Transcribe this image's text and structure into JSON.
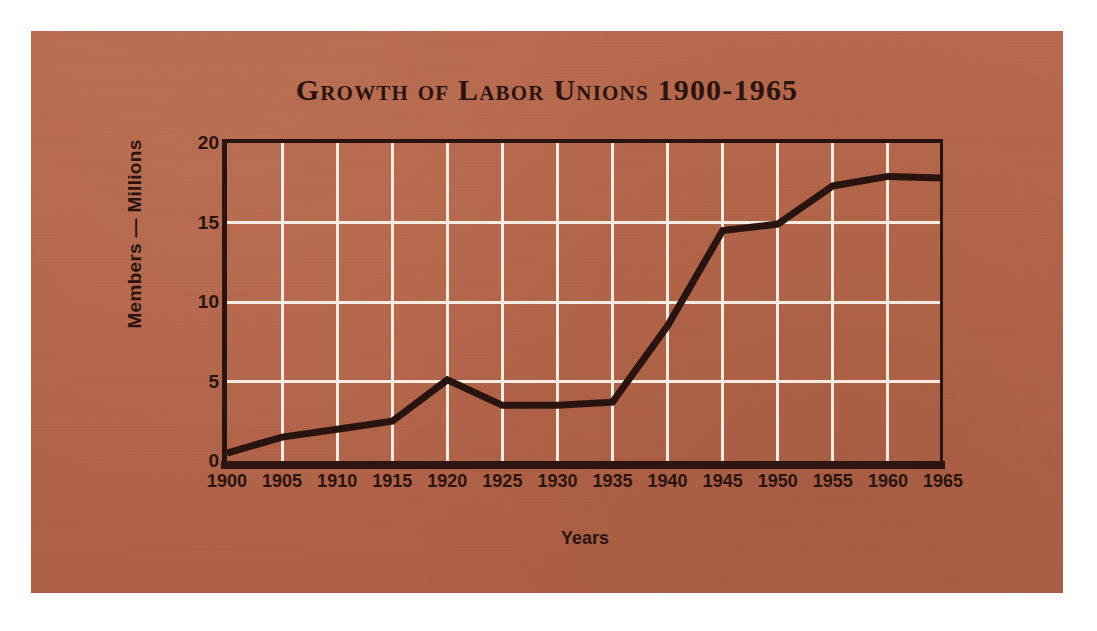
{
  "panel": {
    "background_color": "#b5664a",
    "ink_color": "#2b1410",
    "grid_color": "#f6ece2"
  },
  "chart_data": {
    "type": "line",
    "title": "Growth of Labor Unions 1900-1965",
    "xlabel": "Years",
    "ylabel": "Members — Millions",
    "x": [
      1900,
      1905,
      1910,
      1915,
      1920,
      1925,
      1930,
      1935,
      1940,
      1945,
      1950,
      1955,
      1960,
      1965
    ],
    "values": [
      0.5,
      1.5,
      2.0,
      2.5,
      5.1,
      3.5,
      3.5,
      3.7,
      8.5,
      14.5,
      14.9,
      17.3,
      17.9,
      17.8
    ],
    "xtick_labels": [
      "1900",
      "1905",
      "1910",
      "1915",
      "1920",
      "1925",
      "1930",
      "1935",
      "1940",
      "1945",
      "1950",
      "1955",
      "1960",
      "1965"
    ],
    "ytick_labels": [
      "0",
      "5",
      "10",
      "15",
      "20"
    ],
    "yticks": [
      0,
      5,
      10,
      15,
      20
    ],
    "ylim": [
      0,
      20
    ],
    "xlim": [
      1900,
      1965
    ],
    "grid": true,
    "legend": "none",
    "line_color": "#2a1410",
    "series_name": "Union membership"
  }
}
